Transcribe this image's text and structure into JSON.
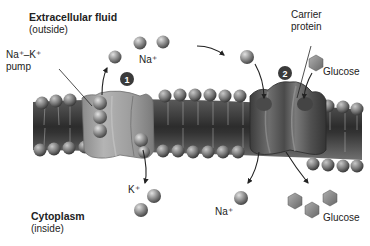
{
  "diagram": {
    "type": "membrane-transport",
    "regions": {
      "outside": {
        "title": "Extracellular fluid",
        "subtitle": "(outside)"
      },
      "inside": {
        "title": "Cytoplasm",
        "subtitle": "(inside)"
      }
    },
    "labels": {
      "pump": "Na⁺–K⁺\npump",
      "pump_line1": "Na⁺–K⁺",
      "pump_line2": "pump",
      "na_outside": "Na⁺",
      "k_inside": "K⁺",
      "carrier_line1": "Carrier",
      "carrier_line2": "protein",
      "glucose_outside": "Glucose",
      "na_inside": "Na⁺",
      "glucose_inside": "Glucose"
    },
    "markers": [
      {
        "id": "1",
        "label": "1",
        "refers_to": "Na+-K+ pump"
      },
      {
        "id": "2",
        "label": "2",
        "refers_to": "Carrier protein"
      }
    ],
    "colors": {
      "ion": "#8a8a8a",
      "ion_highlight": "#d6d6d6",
      "protein_pump": "#9a9a9a",
      "protein_carrier": "#5e5e5e",
      "membrane_core": "#3c3c3c",
      "marker_bg": "#3a3a3a",
      "text": "#222222"
    }
  }
}
